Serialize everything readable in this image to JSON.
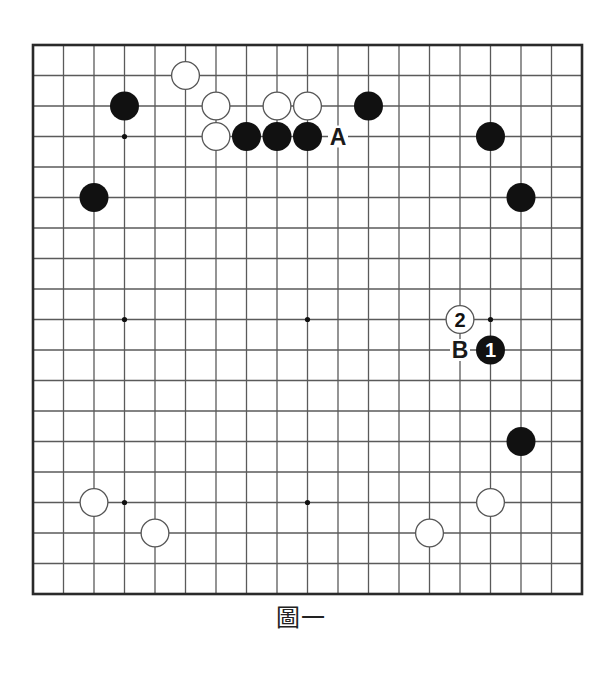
{
  "board": {
    "size": 19,
    "origin_x": 33,
    "origin_y": 45,
    "spacing": 30.5,
    "line_color": "#5a5a5a",
    "border_color": "#2a2a2a",
    "stone_radius": 14.5,
    "black_color": "#111111",
    "white_fill": "#ffffff",
    "white_stroke": "#555555",
    "star_points": [
      [
        3,
        3
      ],
      [
        9,
        3
      ],
      [
        15,
        3
      ],
      [
        3,
        9
      ],
      [
        9,
        9
      ],
      [
        15,
        9
      ],
      [
        3,
        15
      ],
      [
        9,
        15
      ],
      [
        15,
        15
      ]
    ],
    "stones": [
      {
        "col": 5,
        "row": 1,
        "color": "white"
      },
      {
        "col": 3,
        "row": 2,
        "color": "black"
      },
      {
        "col": 6,
        "row": 2,
        "color": "white"
      },
      {
        "col": 8,
        "row": 2,
        "color": "white"
      },
      {
        "col": 9,
        "row": 2,
        "color": "white"
      },
      {
        "col": 11,
        "row": 2,
        "color": "black"
      },
      {
        "col": 6,
        "row": 3,
        "color": "white"
      },
      {
        "col": 7,
        "row": 3,
        "color": "black"
      },
      {
        "col": 8,
        "row": 3,
        "color": "black"
      },
      {
        "col": 9,
        "row": 3,
        "color": "black"
      },
      {
        "col": 15,
        "row": 3,
        "color": "black"
      },
      {
        "col": 2,
        "row": 5,
        "color": "black"
      },
      {
        "col": 16,
        "row": 5,
        "color": "black"
      },
      {
        "col": 14,
        "row": 9,
        "color": "white",
        "label": "2"
      },
      {
        "col": 15,
        "row": 10,
        "color": "black",
        "label": "1"
      },
      {
        "col": 16,
        "row": 13,
        "color": "black"
      },
      {
        "col": 2,
        "row": 15,
        "color": "white"
      },
      {
        "col": 15,
        "row": 15,
        "color": "white"
      },
      {
        "col": 4,
        "row": 16,
        "color": "white"
      },
      {
        "col": 13,
        "row": 16,
        "color": "white"
      }
    ],
    "letter_marks": [
      {
        "col": 10,
        "row": 3,
        "text": "A"
      },
      {
        "col": 14,
        "row": 10,
        "text": "B"
      }
    ]
  },
  "caption": "圖一"
}
